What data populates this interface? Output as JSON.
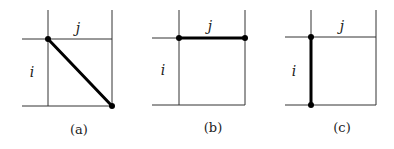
{
  "figure": {
    "panels": [
      {
        "caption": "(a)",
        "col_label": "j",
        "row_label": "i",
        "highlight": "diagonal",
        "grid": {
          "x": [
            48,
            112
          ],
          "y": [
            39,
            106
          ],
          "x_start": 22,
          "y_start": 10
        },
        "edge": {
          "x1": 48,
          "y1": 39,
          "x2": 112,
          "y2": 106
        },
        "label_pos": {
          "j": [
            78,
            33
          ],
          "i": [
            32,
            77
          ],
          "cap": [
            79,
            134
          ]
        }
      },
      {
        "caption": "(b)",
        "col_label": "j",
        "row_label": "i",
        "highlight": "horizontal",
        "grid": {
          "x": [
            179,
            245
          ],
          "y": [
            38,
            105
          ],
          "x_start": 152,
          "y_start": 10
        },
        "edge": {
          "x1": 179,
          "y1": 38,
          "x2": 245,
          "y2": 38
        },
        "label_pos": {
          "j": [
            210,
            31
          ],
          "i": [
            163,
            75
          ],
          "cap": [
            213,
            132
          ]
        }
      },
      {
        "caption": "(c)",
        "col_label": "j",
        "row_label": "i",
        "highlight": "vertical",
        "grid": {
          "x": [
            311,
            376
          ],
          "y": [
            37,
            105
          ],
          "x_start": 285,
          "y_start": 10
        },
        "edge": {
          "x1": 311,
          "y1": 37,
          "x2": 311,
          "y2": 105
        },
        "label_pos": {
          "j": [
            342,
            31
          ],
          "i": [
            294,
            76
          ],
          "cap": [
            342,
            132
          ]
        }
      }
    ],
    "colors": {
      "line": "#333333",
      "edge": "#000000",
      "text": "#222222",
      "background": "#ffffff"
    }
  }
}
